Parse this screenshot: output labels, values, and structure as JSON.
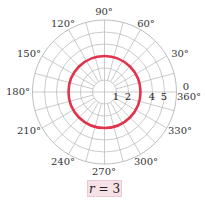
{
  "chart_data": {
    "type": "line",
    "subtype": "polar",
    "title": "",
    "equation": "r = 3",
    "series": [
      {
        "name": "r = 3",
        "color": "#e0334c",
        "r": 3,
        "theta_range_deg": [
          0,
          360
        ]
      }
    ],
    "radial_ticks": [
      1,
      2,
      3,
      4,
      5
    ],
    "radial_max": 6,
    "angular_labels": [
      {
        "angle": 0,
        "label": "0"
      },
      {
        "angle": 360,
        "label": "360°"
      },
      {
        "angle": 30,
        "label": "30°"
      },
      {
        "angle": 60,
        "label": "60°"
      },
      {
        "angle": 90,
        "label": "90°"
      },
      {
        "angle": 120,
        "label": "120°"
      },
      {
        "angle": 150,
        "label": "150°"
      },
      {
        "angle": 180,
        "label": "180°"
      },
      {
        "angle": 210,
        "label": "210°"
      },
      {
        "angle": 240,
        "label": "240°"
      },
      {
        "angle": 270,
        "label": "270°"
      },
      {
        "angle": 300,
        "label": "300°"
      },
      {
        "angle": 330,
        "label": "330°"
      }
    ],
    "spoke_step_deg": 15,
    "grid": true
  },
  "labels": {
    "a0": "0",
    "a360": "360°",
    "a30": "30°",
    "a60": "60°",
    "a90": "90°",
    "a120": "120°",
    "a150": "150°",
    "a180": "180°",
    "a210": "210°",
    "a240": "240°",
    "a270": "270°",
    "a300": "300°",
    "a330": "330°",
    "r1": "1",
    "r2": "2",
    "r4": "4",
    "r5": "5",
    "eq_var": "r",
    "eq_rest": " = 3"
  },
  "colors": {
    "curve": "#e0334c",
    "grid": "#b5b5b5",
    "label_bg": "#f6e1e6"
  }
}
